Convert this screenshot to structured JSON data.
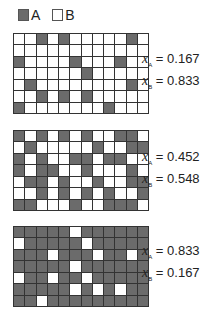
{
  "legend": {
    "items": [
      {
        "label": "A",
        "color": "#6b6b6b"
      },
      {
        "label": "B",
        "color": "#ffffff"
      }
    ]
  },
  "panels": [
    {
      "x_a_label": "x",
      "x_a_sub": "A",
      "x_a_value": "= 0.167",
      "x_b_label": "x",
      "x_b_sub": "B",
      "x_b_value": "= 0.833",
      "rows": 7,
      "cols": 12,
      "a_cells": [
        [
          2,
          4,
          10
        ],
        [],
        [
          0,
          5,
          9
        ],
        [
          6
        ],
        [
          1,
          10
        ],
        [
          2,
          4,
          6
        ],
        [
          0,
          8
        ]
      ]
    },
    {
      "x_a_label": "x",
      "x_a_sub": "A",
      "x_a_value": "= 0.452",
      "x_b_label": "x",
      "x_b_sub": "B",
      "x_b_value": "= 0.548",
      "rows": 7,
      "cols": 12,
      "a_cells": [
        [
          0,
          2,
          4,
          6,
          9,
          10
        ],
        [
          1,
          7,
          10,
          11
        ],
        [
          0,
          2,
          5,
          6,
          8,
          9
        ],
        [
          0,
          2,
          3,
          6,
          10
        ],
        [
          1,
          2,
          4,
          7,
          10,
          11
        ],
        [
          2,
          4,
          6,
          8,
          11
        ],
        [
          0,
          1,
          5,
          8,
          9,
          10
        ]
      ]
    },
    {
      "x_a_label": "x",
      "x_a_sub": "A",
      "x_a_value": "= 0.833",
      "x_b_label": "x",
      "x_b_sub": "B",
      "x_b_value": "= 0.167",
      "rows": 7,
      "cols": 12,
      "b_cells": [
        [
          5
        ],
        [
          0,
          6
        ],
        [
          3,
          7,
          10
        ],
        [
          5
        ],
        [
          0,
          3,
          6
        ],
        [
          5,
          7,
          9
        ],
        [
          2
        ]
      ]
    }
  ]
}
